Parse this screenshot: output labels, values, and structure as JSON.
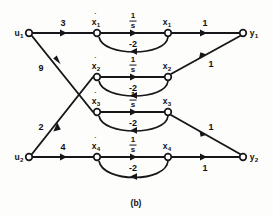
{
  "figure": {
    "caption": "(b)",
    "kind": "signal-flow-graph",
    "ink_color": "#17171a",
    "background_color": "#fdfdfb"
  },
  "nodes": {
    "u1": {
      "label": "u",
      "subscript": "1",
      "dotted": false,
      "x": 29,
      "y": 33
    },
    "u2": {
      "label": "u",
      "subscript": "2",
      "dotted": false,
      "x": 29,
      "y": 157
    },
    "xd1": {
      "label": "x",
      "subscript": "1",
      "dotted": true,
      "x": 97,
      "y": 33
    },
    "xd2": {
      "label": "x",
      "subscript": "2",
      "dotted": true,
      "x": 97,
      "y": 77
    },
    "xd3": {
      "label": "x",
      "subscript": "3",
      "dotted": true,
      "x": 97,
      "y": 112
    },
    "xd4": {
      "label": "x",
      "subscript": "4",
      "dotted": true,
      "x": 97,
      "y": 157
    },
    "x1": {
      "label": "x",
      "subscript": "1",
      "dotted": false,
      "x": 168,
      "y": 33
    },
    "x2": {
      "label": "x",
      "subscript": "2",
      "dotted": false,
      "x": 168,
      "y": 77
    },
    "x3": {
      "label": "x",
      "subscript": "3",
      "dotted": false,
      "x": 168,
      "y": 112
    },
    "x4": {
      "label": "x",
      "subscript": "4",
      "dotted": false,
      "x": 168,
      "y": 157
    },
    "y1": {
      "label": "y",
      "subscript": "1",
      "dotted": false,
      "x": 243,
      "y": 33
    },
    "y2": {
      "label": "y",
      "subscript": "2",
      "dotted": false,
      "x": 243,
      "y": 157
    }
  },
  "edges": [
    {
      "id": "u1-xd1",
      "from": "u1",
      "to": "xd1",
      "gain": "3",
      "gain_x": 63,
      "gain_y": 23
    },
    {
      "id": "u1-xd3",
      "from": "u1",
      "to": "xd3",
      "gain": "9",
      "gain_x": 41,
      "gain_y": 68
    },
    {
      "id": "u2-xd2",
      "from": "u2",
      "to": "xd2",
      "gain": "2",
      "gain_x": 41,
      "gain_y": 127
    },
    {
      "id": "u2-xd4",
      "from": "u2",
      "to": "xd4",
      "gain": "4",
      "gain_x": 63,
      "gain_y": 147
    },
    {
      "id": "xd1-x1",
      "from": "xd1",
      "to": "x1",
      "gain": "1/s",
      "gain_x": 133,
      "gain_y": 21
    },
    {
      "id": "xd2-x2",
      "from": "xd2",
      "to": "x2",
      "gain": "1/s",
      "gain_x": 133,
      "gain_y": 65
    },
    {
      "id": "xd3-x3",
      "from": "xd3",
      "to": "x3",
      "gain": "1/s",
      "gain_x": 133,
      "gain_y": 100
    },
    {
      "id": "xd4-x4",
      "from": "xd4",
      "to": "x4",
      "gain": "1/s",
      "gain_x": 133,
      "gain_y": 145
    },
    {
      "id": "x1-xd1",
      "from": "x1",
      "to": "xd1",
      "gain": "-2",
      "gain_x": 133,
      "gain_y": 44
    },
    {
      "id": "x2-xd2",
      "from": "x2",
      "to": "xd2",
      "gain": "-2",
      "gain_x": 133,
      "gain_y": 88
    },
    {
      "id": "x3-xd3",
      "from": "x3",
      "to": "xd3",
      "gain": "-2",
      "gain_x": 133,
      "gain_y": 123
    },
    {
      "id": "x4-xd4",
      "from": "x4",
      "to": "xd4",
      "gain": "-2",
      "gain_x": 133,
      "gain_y": 168
    },
    {
      "id": "x1-y1",
      "from": "x1",
      "to": "y1",
      "gain": "1",
      "gain_x": 205,
      "gain_y": 23
    },
    {
      "id": "x2-y1",
      "from": "x2",
      "to": "y1",
      "gain": "1",
      "gain_x": 211,
      "gain_y": 64
    },
    {
      "id": "x3-y2",
      "from": "x3",
      "to": "y2",
      "gain": "1",
      "gain_x": 211,
      "gain_y": 127
    },
    {
      "id": "x4-y2",
      "from": "x4",
      "to": "y2",
      "gain": "1",
      "gain_x": 205,
      "gain_y": 168
    }
  ],
  "fractions": {
    "numerator": "1",
    "denominator": "s"
  },
  "feedback_gain": "-2"
}
